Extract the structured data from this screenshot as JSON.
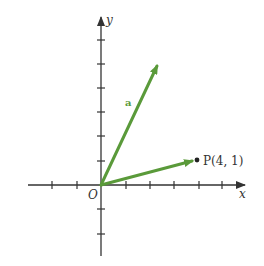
{
  "diagram": {
    "type": "vector-plane",
    "axes": {
      "x_label": "x",
      "y_label": "y",
      "origin_label": "O",
      "x_ticks": [
        -2,
        -1,
        1,
        2,
        3,
        4,
        5
      ],
      "y_ticks": [
        -2,
        -1,
        1,
        2,
        3,
        4,
        5,
        6
      ]
    },
    "vectors": [
      {
        "name": "a",
        "label": "a",
        "from": [
          0,
          0
        ],
        "to": [
          2.3,
          4.9
        ],
        "color": "#5a9a3a"
      },
      {
        "name": "OP",
        "label": "",
        "from": [
          0,
          0
        ],
        "to": [
          4,
          1
        ],
        "color": "#5a9a3a"
      }
    ],
    "points": [
      {
        "name": "P",
        "label": "P(4, 1)",
        "coords": [
          4,
          1
        ]
      }
    ],
    "colors": {
      "axis": "#333333",
      "vector": "#5a9a3a",
      "background": "#ffffff"
    }
  }
}
